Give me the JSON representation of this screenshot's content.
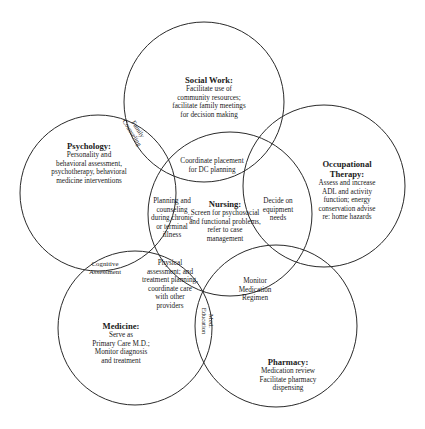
{
  "colors": {
    "background": "#ffffff",
    "stroke": "#2a2a2a",
    "text": "#1a1a1a"
  },
  "circles": [
    {
      "id": "social-work",
      "cx": 204,
      "cy": 102,
      "r": 80
    },
    {
      "id": "psychology",
      "cx": 98,
      "cy": 193,
      "r": 78
    },
    {
      "id": "occupational-therapy",
      "cx": 324,
      "cy": 186,
      "r": 81
    },
    {
      "id": "nursing",
      "cx": 230,
      "cy": 214,
      "r": 82
    },
    {
      "id": "medicine",
      "cx": 135,
      "cy": 328,
      "r": 77
    },
    {
      "id": "pharmacy",
      "cx": 276,
      "cy": 326,
      "r": 81
    }
  ],
  "disciplines": {
    "social_work": {
      "title": "Social Work:",
      "lines": [
        "Facilitate use of",
        "community resources;",
        "facilitate family meetings",
        "for decision making"
      ]
    },
    "psychology": {
      "title": "Psychology:",
      "lines": [
        "Personality and",
        "behavioral assessment,",
        "psychotherapy, behavioral",
        "medicine interventions"
      ]
    },
    "occupational_therapy": {
      "title_lines": [
        "Occupational",
        "Therapy:"
      ],
      "lines": [
        "Assess and increase",
        "ADL and activity",
        "function; energy",
        "conservation advise",
        "re: home hazards"
      ]
    },
    "nursing": {
      "title": "Nursing:",
      "lines": [
        "Screen for psychosocial",
        "and functional problems,",
        "refer to case",
        "management"
      ]
    },
    "medicine": {
      "title": "Medicine:",
      "lines": [
        "Serve as",
        "Primary Care M.D.;",
        "Monitor diagnosis",
        "and treatment"
      ]
    },
    "pharmacy": {
      "title": "Pharmacy:",
      "lines": [
        "Medication review",
        "Facilitate pharmacy",
        "dispensing"
      ]
    }
  },
  "overlaps": {
    "family_counseling": {
      "lines": [
        "Family",
        "Counseling"
      ]
    },
    "coordinate_placement": {
      "lines": [
        "Coordinate placement",
        "for DC planning"
      ]
    },
    "planning_counseling": {
      "lines": [
        "Planning and",
        "counseling",
        "during chronic",
        "or terminal",
        "illness"
      ]
    },
    "decide_equipment": {
      "lines": [
        "Decide on",
        "equipment",
        "needs"
      ]
    },
    "cognitive_assessment": {
      "lines": [
        "Cognitive",
        "Assessment"
      ]
    },
    "physical_assessment": {
      "lines": [
        "Physical",
        "assessment; and",
        "treatment planning,",
        "coordinate care",
        "with other",
        "providers"
      ]
    },
    "monitor_medication": {
      "lines": [
        "Monitor",
        "Medication",
        "Regimen"
      ]
    },
    "med_education": {
      "lines": [
        "Med.",
        "Education"
      ]
    }
  }
}
